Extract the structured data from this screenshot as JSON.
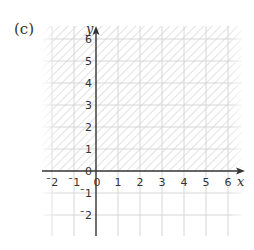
{
  "part_label": "(c)",
  "graph": {
    "x_axis_label": "x",
    "y_axis_label": "y",
    "x_ticks": [
      "¯2",
      "¯1",
      "0",
      "1",
      "2",
      "3",
      "4",
      "5",
      "6"
    ],
    "y_ticks_positive": [
      "6",
      "5",
      "4",
      "3",
      "2",
      "1",
      "0"
    ],
    "y_ticks_negative": [
      "¯1",
      "¯2"
    ],
    "x_range": [
      -2,
      6
    ],
    "y_range": [
      -2,
      6
    ],
    "shaded_region": "y >= 0",
    "colors": {
      "grid": "#d8d8d8",
      "hatch": "#c8c8c8",
      "axis": "#333333"
    }
  }
}
